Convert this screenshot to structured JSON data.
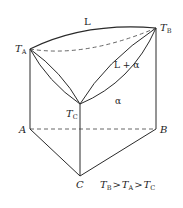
{
  "diagram": {
    "labels": {
      "liquid": "L",
      "two_phase": "L + α",
      "solid": "α",
      "TA_main": "T",
      "TA_sub": "A",
      "TB_main": "T",
      "TB_sub": "B",
      "TC_main": "T",
      "TC_sub": "C",
      "vertex_A": "A",
      "vertex_B": "B",
      "vertex_C": "C"
    },
    "relation": {
      "t1": "T",
      "s1": "B",
      "gt1": ">",
      "t2": "T",
      "s2": "A",
      "gt2": ">",
      "t3": "T",
      "s3": "C"
    },
    "colors": {
      "line": "#2a2a2a",
      "dash": "#555555"
    }
  }
}
